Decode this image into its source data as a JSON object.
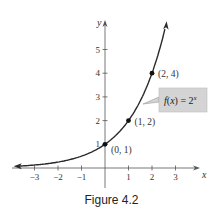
{
  "chart_data": {
    "type": "line",
    "title": "",
    "function_label": "f(x) = 2^x",
    "function_label_base": "f(x) = 2",
    "function_label_exp": "x",
    "xlabel": "x",
    "ylabel": "y",
    "xlim": [
      -3.8,
      3.8
    ],
    "ylim": [
      -0.6,
      6
    ],
    "x_ticks": [
      -3,
      -2,
      -1,
      1,
      2,
      3
    ],
    "x_tick_labels": [
      "−3",
      "−2",
      "−1",
      "1",
      "2",
      "3"
    ],
    "y_ticks": [
      1,
      2,
      3,
      4,
      5
    ],
    "y_tick_labels": [
      "1",
      "2",
      "3",
      "4",
      "5"
    ],
    "grid": false,
    "series": [
      {
        "name": "f(x) = 2^x",
        "x": [
          -3.8,
          -3,
          -2,
          -1,
          0,
          1,
          2,
          2.6
        ],
        "values": [
          0.07,
          0.125,
          0.25,
          0.5,
          1,
          2,
          4,
          6.06
        ]
      }
    ],
    "points": [
      {
        "x": 0,
        "y": 1,
        "label": "(0, 1)"
      },
      {
        "x": 1,
        "y": 2,
        "label": "(1, 2)"
      },
      {
        "x": 2,
        "y": 4,
        "label": "(2, 4)"
      }
    ],
    "caption": "Figure 4.2"
  }
}
